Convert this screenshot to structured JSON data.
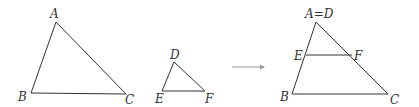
{
  "diagram": {
    "triangle_abc": {
      "labels": {
        "A": "A",
        "B": "B",
        "C": "C"
      },
      "vertices": {
        "A": [
          56,
          22
        ],
        "B": [
          31,
          93
        ],
        "C": [
          126,
          94
        ]
      }
    },
    "triangle_def": {
      "labels": {
        "D": "D",
        "E": "E",
        "F": "F"
      },
      "vertices": {
        "D": [
          174,
          62
        ],
        "E": [
          162,
          91
        ],
        "F": [
          205,
          91
        ]
      }
    },
    "arrow": {
      "from": [
        232,
        67
      ],
      "to": [
        265,
        67
      ],
      "color": "#9a9a9a"
    },
    "combined": {
      "labels": {
        "AD": "A=D",
        "E": "E",
        "F": "F",
        "B": "B",
        "C": "C"
      },
      "vertices": {
        "AD": [
          316,
          22
        ],
        "B": [
          292,
          94
        ],
        "C": [
          388,
          94
        ],
        "E": [
          306,
          55
        ],
        "F": [
          352,
          55
        ]
      }
    },
    "colors": {
      "stroke": "#333333",
      "text": "#333333",
      "background": "#ffffff"
    }
  }
}
